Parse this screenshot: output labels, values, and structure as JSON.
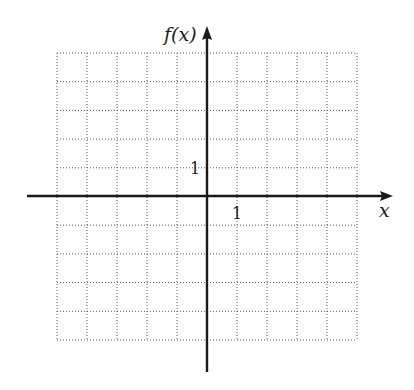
{
  "chart_data": {
    "type": "line",
    "title": "",
    "xlabel": "x",
    "ylabel": "f(x)",
    "xlim": [
      -5,
      5
    ],
    "ylim": [
      -5,
      5
    ],
    "grid": true,
    "grid_style": "dotted",
    "x_tick_labels": [
      {
        "value": 1,
        "label": "1"
      }
    ],
    "y_tick_labels": [
      {
        "value": 1,
        "label": "1"
      }
    ],
    "series": [],
    "legend": null
  },
  "labels": {
    "x_axis": "x",
    "y_axis": "f(x)",
    "x_unit": "1",
    "y_unit": "1"
  },
  "colors": {
    "axis": "#1a1a1a",
    "grid": "#555555",
    "background": "#ffffff"
  }
}
